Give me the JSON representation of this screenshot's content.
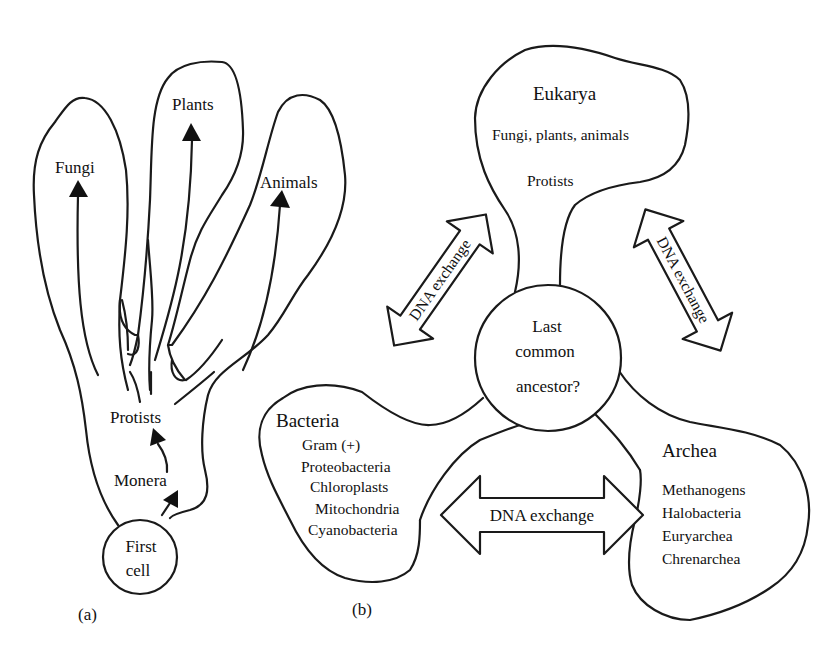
{
  "panel_a": {
    "label": "(a)",
    "branches": {
      "fungi": "Fungi",
      "plants": "Plants",
      "animals": "Animals"
    },
    "protists": "Protists",
    "monera": "Monera",
    "first_cell": {
      "line1": "First",
      "line2": "cell"
    }
  },
  "panel_b": {
    "label": "(b)",
    "eukarya": {
      "title": "Eukarya",
      "line1": "Fungi, plants, animals",
      "line2": "Protists"
    },
    "ancestor": {
      "line1": "Last",
      "line2": "common",
      "line3": "ancestor?"
    },
    "bacteria": {
      "title": "Bacteria",
      "items": [
        "Gram (+)",
        "Proteobacteria",
        "Chloroplasts",
        "Mitochondria",
        "Cyanobacteria"
      ]
    },
    "archea": {
      "title": "Archea",
      "items": [
        "Methanogens",
        "Halobacteria",
        "Euryarchea",
        "Chrenarchea"
      ]
    },
    "exchange_arrows": {
      "left": "DNA exchange",
      "right": "DNA exchange",
      "bottom": "DNA exchange"
    }
  },
  "colors": {
    "stroke": "#1a1a1a",
    "background": "#ffffff"
  }
}
